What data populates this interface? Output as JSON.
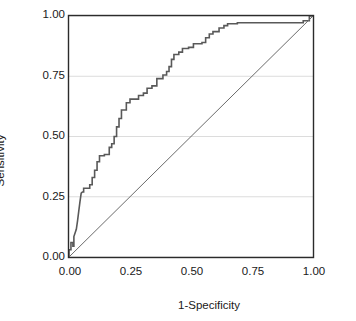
{
  "chart_data": {
    "type": "line",
    "title": "",
    "subtitle": "",
    "xlabel": "1-Specificity",
    "ylabel": "Sensitivity",
    "xlim": [
      0.0,
      1.0
    ],
    "ylim": [
      0.0,
      1.0
    ],
    "xticks": [
      "0.00",
      "0.25",
      "0.50",
      "0.75",
      "1.00"
    ],
    "xtick_values": [
      0.0,
      0.25,
      0.5,
      0.75,
      1.0
    ],
    "yticks": [
      "0.00",
      "0.25",
      "0.50",
      "0.75",
      "1.00"
    ],
    "ytick_values": [
      0.0,
      0.25,
      0.5,
      0.75,
      1.0
    ],
    "grid": "horizontal",
    "legend": "none",
    "series": [
      {
        "name": "ROC curve",
        "style": "step",
        "color": "#595959",
        "width": 1.6,
        "points": [
          [
            0.0,
            0.0
          ],
          [
            0.0,
            0.03
          ],
          [
            0.008,
            0.03
          ],
          [
            0.008,
            0.06
          ],
          [
            0.016,
            0.06
          ],
          [
            0.016,
            0.045
          ],
          [
            0.02,
            0.045
          ],
          [
            0.02,
            0.085
          ],
          [
            0.03,
            0.115
          ],
          [
            0.035,
            0.15
          ],
          [
            0.04,
            0.19
          ],
          [
            0.045,
            0.23
          ],
          [
            0.05,
            0.265
          ],
          [
            0.055,
            0.27
          ],
          [
            0.06,
            0.27
          ],
          [
            0.06,
            0.285
          ],
          [
            0.085,
            0.285
          ],
          [
            0.085,
            0.3
          ],
          [
            0.095,
            0.3
          ],
          [
            0.095,
            0.33
          ],
          [
            0.105,
            0.33
          ],
          [
            0.105,
            0.36
          ],
          [
            0.115,
            0.36
          ],
          [
            0.115,
            0.395
          ],
          [
            0.125,
            0.395
          ],
          [
            0.125,
            0.42
          ],
          [
            0.145,
            0.42
          ],
          [
            0.145,
            0.425
          ],
          [
            0.165,
            0.425
          ],
          [
            0.165,
            0.455
          ],
          [
            0.175,
            0.455
          ],
          [
            0.175,
            0.47
          ],
          [
            0.185,
            0.47
          ],
          [
            0.185,
            0.5
          ],
          [
            0.195,
            0.5
          ],
          [
            0.195,
            0.54
          ],
          [
            0.205,
            0.54
          ],
          [
            0.205,
            0.575
          ],
          [
            0.215,
            0.575
          ],
          [
            0.215,
            0.61
          ],
          [
            0.235,
            0.61
          ],
          [
            0.235,
            0.64
          ],
          [
            0.25,
            0.64
          ],
          [
            0.25,
            0.655
          ],
          [
            0.285,
            0.655
          ],
          [
            0.285,
            0.67
          ],
          [
            0.305,
            0.67
          ],
          [
            0.305,
            0.68
          ],
          [
            0.32,
            0.68
          ],
          [
            0.32,
            0.7
          ],
          [
            0.34,
            0.7
          ],
          [
            0.34,
            0.71
          ],
          [
            0.36,
            0.71
          ],
          [
            0.36,
            0.74
          ],
          [
            0.385,
            0.74
          ],
          [
            0.385,
            0.755
          ],
          [
            0.4,
            0.755
          ],
          [
            0.4,
            0.77
          ],
          [
            0.41,
            0.77
          ],
          [
            0.41,
            0.79
          ],
          [
            0.42,
            0.79
          ],
          [
            0.42,
            0.82
          ],
          [
            0.43,
            0.82
          ],
          [
            0.43,
            0.84
          ],
          [
            0.45,
            0.84
          ],
          [
            0.45,
            0.85
          ],
          [
            0.465,
            0.85
          ],
          [
            0.465,
            0.865
          ],
          [
            0.49,
            0.865
          ],
          [
            0.49,
            0.87
          ],
          [
            0.51,
            0.87
          ],
          [
            0.51,
            0.885
          ],
          [
            0.545,
            0.885
          ],
          [
            0.545,
            0.89
          ],
          [
            0.56,
            0.89
          ],
          [
            0.56,
            0.91
          ],
          [
            0.575,
            0.91
          ],
          [
            0.575,
            0.925
          ],
          [
            0.59,
            0.925
          ],
          [
            0.59,
            0.935
          ],
          [
            0.615,
            0.935
          ],
          [
            0.615,
            0.95
          ],
          [
            0.635,
            0.95
          ],
          [
            0.635,
            0.96
          ],
          [
            0.65,
            0.96
          ],
          [
            0.65,
            0.968
          ],
          [
            0.69,
            0.968
          ],
          [
            0.69,
            0.972
          ],
          [
            0.96,
            0.972
          ],
          [
            0.96,
            0.98
          ],
          [
            0.985,
            0.98
          ],
          [
            0.985,
            1.0
          ],
          [
            1.0,
            1.0
          ]
        ]
      },
      {
        "name": "Reference diagonal",
        "style": "line",
        "color": "#6b6b6b",
        "width": 1.0,
        "points": [
          [
            0.0,
            0.0
          ],
          [
            1.0,
            1.0
          ]
        ]
      }
    ],
    "axis_color": "#2b2b2b",
    "grid_color": "#dcdcdc",
    "background": "#ffffff"
  }
}
